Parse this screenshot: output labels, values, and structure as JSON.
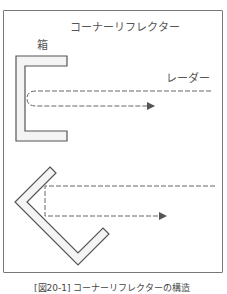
{
  "figure": {
    "title": "コーナーリフレクター",
    "box_label": "箱",
    "radar_label": "レーダー",
    "caption": "[図20-1] コーナーリフレクターの構造"
  },
  "colors": {
    "stroke": "#555555",
    "fill": "#f4f4f4",
    "dash": "#666666",
    "frame": "#777777"
  }
}
